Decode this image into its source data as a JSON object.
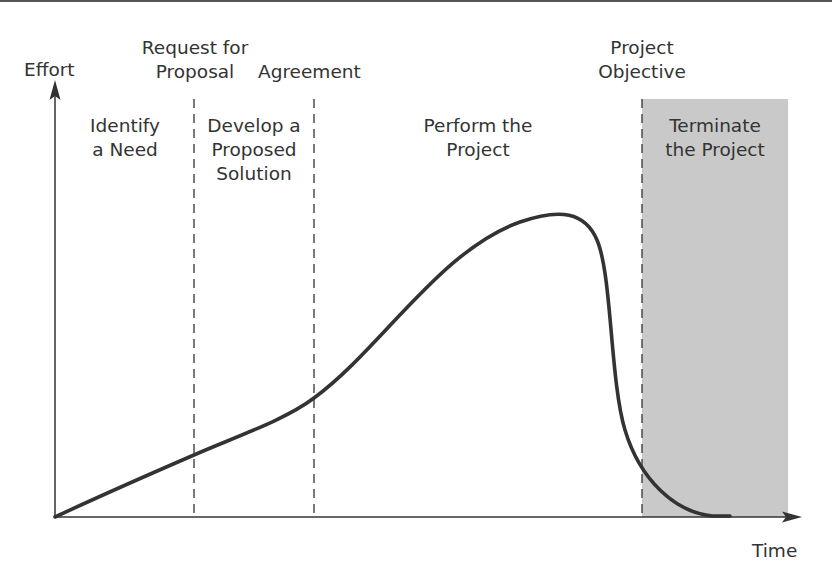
{
  "diagram": {
    "type": "project-life-cycle-effort-curve",
    "axes": {
      "y_label": "Effort",
      "x_label": "Time"
    },
    "milestones": [
      {
        "line1": "Request for",
        "line2": "Proposal"
      },
      {
        "line1": "Agreement"
      },
      {
        "line1": "Project",
        "line2": "Objective"
      }
    ],
    "phases": [
      {
        "line1": "Identify",
        "line2": "a Need"
      },
      {
        "line1": "Develop a",
        "line2": "Proposed",
        "line3": "Solution"
      },
      {
        "line1": "Perform the",
        "line2": "Project"
      },
      {
        "line1": "Terminate",
        "line2": "the Project",
        "shaded": true
      }
    ],
    "colors": {
      "curve": "#333333",
      "axis": "#333333",
      "shade": "#c9c9c9",
      "dashed": "#333333"
    }
  }
}
